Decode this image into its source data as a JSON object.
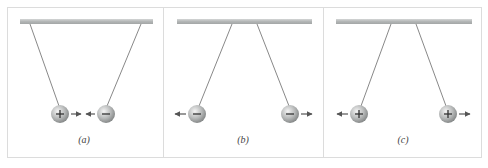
{
  "figure": {
    "colors": {
      "panel_border": "#dcdcdc",
      "bar": "#b9bcbc",
      "string": "#6a6a6a",
      "ball_light": "#e8e8e8",
      "ball_dark": "#8e9090",
      "arrow": "#555555",
      "sign": "#333333"
    },
    "panels": [
      {
        "id": "a",
        "label": "(a)",
        "balls": [
          {
            "charge": "positive",
            "symbol": "+",
            "force_direction": "right"
          },
          {
            "charge": "negative",
            "symbol": "−",
            "force_direction": "left"
          }
        ],
        "interaction": "attract"
      },
      {
        "id": "b",
        "label": "(b)",
        "balls": [
          {
            "charge": "negative",
            "symbol": "−",
            "force_direction": "left"
          },
          {
            "charge": "negative",
            "symbol": "−",
            "force_direction": "right"
          }
        ],
        "interaction": "repel"
      },
      {
        "id": "c",
        "label": "(c)",
        "balls": [
          {
            "charge": "positive",
            "symbol": "+",
            "force_direction": "left"
          },
          {
            "charge": "positive",
            "symbol": "+",
            "force_direction": "right"
          }
        ],
        "interaction": "repel"
      }
    ]
  }
}
